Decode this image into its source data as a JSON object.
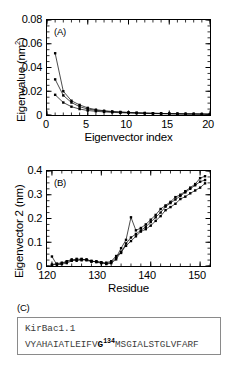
{
  "figure": {
    "panels": [
      "A",
      "B",
      "C"
    ]
  },
  "panelA": {
    "tag": "(A)",
    "ylabel_text": "Eigenvalue (nm",
    "ylabel_sup": "2",
    "ylabel_tail": ")",
    "xlabel": "Eigenvector index",
    "yticks": [
      "0",
      "0.02",
      "0.04",
      "0.06",
      "0.08"
    ],
    "xticks": [
      "0",
      "5",
      "10",
      "15",
      "20"
    ]
  },
  "panelB": {
    "tag": "(B)",
    "ylabel": "Eigenvector 2 (nm)",
    "xlabel": "Residue",
    "yticks": [
      "0",
      "0.1",
      "0.2",
      "0.3",
      "0.4"
    ],
    "xticks": [
      "120",
      "130",
      "140",
      "150"
    ]
  },
  "panelC": {
    "tag": "(C)",
    "protein_name": "KirBac1.1",
    "sequence_pre": "VYAHAIATLEIFV",
    "sequence_marked": "G",
    "sequence_sup": "134",
    "sequence_post": "MSGIALSTGLVFARF"
  },
  "chart_data": [
    {
      "type": "line",
      "panel": "A",
      "title": "(A)",
      "xlabel": "Eigenvector index",
      "ylabel": "Eigenvalue (nm^2)",
      "xlim": [
        0,
        20
      ],
      "ylim": [
        0,
        0.08
      ],
      "xticks": [
        0,
        5,
        10,
        15,
        20
      ],
      "yticks": [
        0,
        0.02,
        0.04,
        0.06,
        0.08
      ],
      "grid": false,
      "legend": "none",
      "marker": "filled-square",
      "x": [
        1,
        2,
        3,
        4,
        5,
        6,
        7,
        8,
        9,
        10,
        11,
        12,
        13,
        14,
        15,
        16,
        17,
        18,
        19,
        20
      ],
      "series": [
        {
          "name": "run 1",
          "values": [
            0.052,
            0.02,
            0.012,
            0.0085,
            0.006,
            0.0045,
            0.0036,
            0.003,
            0.0026,
            0.0022,
            0.0019,
            0.0017,
            0.0015,
            0.0013,
            0.0012,
            0.0011,
            0.001,
            0.0009,
            0.0008,
            0.0008
          ]
        },
        {
          "name": "run 2",
          "values": [
            0.03,
            0.0165,
            0.0105,
            0.007,
            0.005,
            0.004,
            0.0032,
            0.0027,
            0.0023,
            0.002,
            0.0018,
            0.0016,
            0.0014,
            0.0013,
            0.0011,
            0.001,
            0.0009,
            0.0009,
            0.0008,
            0.0007
          ]
        },
        {
          "name": "run 3",
          "values": [
            0.017,
            0.0105,
            0.007,
            0.005,
            0.0038,
            0.0031,
            0.0026,
            0.0022,
            0.0019,
            0.0017,
            0.0015,
            0.0013,
            0.0012,
            0.0011,
            0.001,
            0.0009,
            0.0008,
            0.0008,
            0.0007,
            0.0006
          ]
        }
      ]
    },
    {
      "type": "line",
      "panel": "B",
      "title": "(B)",
      "xlabel": "Residue",
      "ylabel": "Eigenvector 2 (nm)",
      "xlim": [
        119,
        152
      ],
      "ylim": [
        0,
        0.4
      ],
      "xticks": [
        120,
        130,
        140,
        150
      ],
      "yticks": [
        0,
        0.1,
        0.2,
        0.3,
        0.4
      ],
      "grid": false,
      "legend": "none",
      "marker": "filled-square",
      "x": [
        120,
        121,
        122,
        123,
        124,
        125,
        126,
        127,
        128,
        129,
        130,
        131,
        132,
        133,
        134,
        135,
        136,
        137,
        138,
        139,
        140,
        141,
        142,
        143,
        144,
        145,
        146,
        147,
        148,
        149,
        150,
        151
      ],
      "series": [
        {
          "name": "run 1",
          "values": [
            0.04,
            0.005,
            0.008,
            0.012,
            0.022,
            0.026,
            0.024,
            0.028,
            0.02,
            0.018,
            0.014,
            0.01,
            0.016,
            0.035,
            0.075,
            0.11,
            0.205,
            0.15,
            0.16,
            0.175,
            0.195,
            0.215,
            0.24,
            0.255,
            0.27,
            0.29,
            0.3,
            0.315,
            0.33,
            0.345,
            0.37,
            0.378
          ]
        },
        {
          "name": "run 2",
          "values": [
            0.006,
            0.01,
            0.014,
            0.018,
            0.024,
            0.03,
            0.028,
            0.026,
            0.022,
            0.016,
            0.012,
            0.014,
            0.02,
            0.042,
            0.055,
            0.095,
            0.12,
            0.135,
            0.15,
            0.165,
            0.185,
            0.205,
            0.225,
            0.25,
            0.265,
            0.28,
            0.295,
            0.31,
            0.325,
            0.34,
            0.355,
            0.362
          ]
        },
        {
          "name": "run 3",
          "values": [
            0.004,
            0.008,
            0.01,
            0.02,
            0.028,
            0.022,
            0.03,
            0.024,
            0.018,
            0.02,
            0.016,
            0.008,
            0.012,
            0.028,
            0.06,
            0.085,
            0.105,
            0.125,
            0.145,
            0.155,
            0.17,
            0.19,
            0.21,
            0.235,
            0.248,
            0.262,
            0.282,
            0.292,
            0.306,
            0.318,
            0.33,
            0.348
          ]
        }
      ]
    }
  ]
}
